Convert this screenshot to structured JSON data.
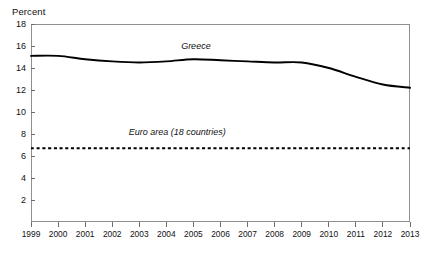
{
  "chart_data": {
    "type": "line",
    "title": "",
    "subtitle": "",
    "xlabel": "",
    "ylabel": "Percent",
    "ylim": [
      0,
      18
    ],
    "xlim": [
      1999,
      2013
    ],
    "grid": false,
    "legend_position": "inline-annotation",
    "y_ticks": [
      2,
      4,
      6,
      8,
      10,
      12,
      14,
      16,
      18
    ],
    "y_tick_labels": [
      "2",
      "4",
      "6",
      "8",
      "10",
      "12",
      "14",
      "16",
      "18"
    ],
    "x": [
      1999,
      2000,
      2001,
      2002,
      2003,
      2004,
      2005,
      2006,
      2007,
      2008,
      2009,
      2010,
      2011,
      2012,
      2013
    ],
    "x_tick_labels": [
      "1999",
      "2000",
      "2001",
      "2002",
      "2003",
      "2004",
      "2005",
      "2006",
      "2007",
      "2008",
      "2009",
      "2010",
      "2011",
      "2012",
      "2013"
    ],
    "series": [
      {
        "name": "Greece",
        "style": "solid",
        "color": "#000000",
        "values": [
          15.1,
          15.1,
          14.8,
          14.6,
          14.5,
          14.6,
          14.8,
          14.7,
          14.6,
          14.5,
          14.5,
          14.0,
          13.2,
          12.5,
          12.2
        ]
      },
      {
        "name": "Euro area (18 countries)",
        "style": "dotted",
        "color": "#000000",
        "values": [
          6.7,
          6.7,
          6.7,
          6.7,
          6.7,
          6.7,
          6.7,
          6.7,
          6.7,
          6.7,
          6.7,
          6.7,
          6.7,
          6.7,
          6.7
        ]
      }
    ],
    "annotations": [
      {
        "text": "Greece",
        "x": 2005.1,
        "y": 16.0
      },
      {
        "text": "Euro area (18 countries)",
        "x": 2004.4,
        "y": 8.2
      }
    ]
  }
}
